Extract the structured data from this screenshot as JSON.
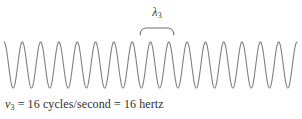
{
  "figure": {
    "name": "wave-frequency-diagram",
    "background_color": "#ffffff",
    "stroke_color": "#808080",
    "text_color": "#2e2e2e"
  },
  "wavelength_annotation": {
    "symbol": "λ",
    "subscript": "3",
    "brace_label": "wavelength-brace"
  },
  "caption": {
    "symbol": "ν",
    "subscript": "3",
    "text": " = 16 cycles/second = 16 hertz",
    "full_text": "ν3 = 16 cycles/second = 16 hertz"
  },
  "chart_data": {
    "type": "line",
    "title": "",
    "subtitle": "",
    "xlabel": "",
    "ylabel": "",
    "legend": [],
    "grid": false,
    "annotations": [
      {
        "label": "λ₃",
        "kind": "wavelength-brace",
        "x_start": 141,
        "x_end": 173
      },
      {
        "label": "ν₃ = 16 cycles/second = 16 hertz",
        "kind": "caption"
      }
    ],
    "waveform": {
      "shape": "sine",
      "cycles": 16,
      "frequency_hz": 16,
      "amplitude_px": 23,
      "wavelength_px": 18.3,
      "x_start_px": 4,
      "x_end_px": 297,
      "midline_y_px": 65,
      "stroke_width": 1.1,
      "stroke_color": "#808080"
    },
    "x": [
      0,
      1
    ],
    "values": [
      0,
      0
    ]
  }
}
